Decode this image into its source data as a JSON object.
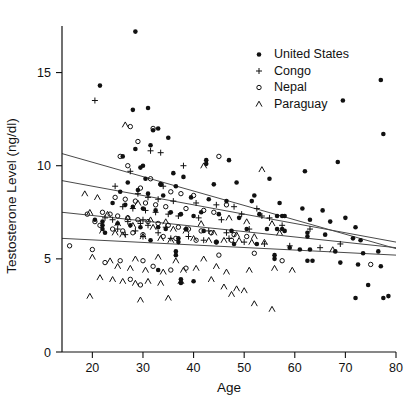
{
  "chart_data": {
    "type": "scatter",
    "title": "",
    "xlabel": "Age",
    "ylabel": "Testosterone Level (ng/dl)",
    "xlim": [
      14,
      80
    ],
    "ylim": [
      0,
      17.5
    ],
    "xticks": [
      20,
      30,
      40,
      50,
      60,
      70,
      80
    ],
    "yticks": [
      0,
      5,
      10,
      15
    ],
    "grid": false,
    "legend_position": "top-right",
    "legend": [
      {
        "name": "United States",
        "marker": "filled-circle"
      },
      {
        "name": "Congo",
        "marker": "plus"
      },
      {
        "name": "Nepal",
        "marker": "open-circle"
      },
      {
        "name": "Paraguay",
        "marker": "caret"
      }
    ],
    "series": [
      {
        "name": "United States",
        "marker": "filled-circle",
        "trendline": {
          "x0": 14,
          "y0": 10.65,
          "x1": 80,
          "y1": 5.55
        },
        "points": [
          [
            28.5,
            17.2
          ],
          [
            21.5,
            14.3
          ],
          [
            77.0,
            14.6
          ],
          [
            28.0,
            13.0
          ],
          [
            31.0,
            13.1
          ],
          [
            69.5,
            13.5
          ],
          [
            33.0,
            12.0
          ],
          [
            77.5,
            11.7
          ],
          [
            35.0,
            11.5
          ],
          [
            32.0,
            11.9
          ],
          [
            31.5,
            11.1
          ],
          [
            28.5,
            10.9
          ],
          [
            26.0,
            10.5
          ],
          [
            42.5,
            10.3
          ],
          [
            42.5,
            10.1
          ],
          [
            29.5,
            9.9
          ],
          [
            30.0,
            10.0
          ],
          [
            47.0,
            10.3
          ],
          [
            68.5,
            10.2
          ],
          [
            36.0,
            9.6
          ],
          [
            30.5,
            9.3
          ],
          [
            62.0,
            9.7
          ],
          [
            55.0,
            9.3
          ],
          [
            38.0,
            9.4
          ],
          [
            27.0,
            9.1
          ],
          [
            33.5,
            9.0
          ],
          [
            44.0,
            9.0
          ],
          [
            48.5,
            9.1
          ],
          [
            36.5,
            8.9
          ],
          [
            29.0,
            8.7
          ],
          [
            25.5,
            8.6
          ],
          [
            31.0,
            8.5
          ],
          [
            34.0,
            8.4
          ],
          [
            39.5,
            8.3
          ],
          [
            43.0,
            8.2
          ],
          [
            46.5,
            8.1
          ],
          [
            52.0,
            8.4
          ],
          [
            51.5,
            8.1
          ],
          [
            57.0,
            8.0
          ],
          [
            61.5,
            7.7
          ],
          [
            65.5,
            7.6
          ],
          [
            70.0,
            7.2
          ],
          [
            24.0,
            8.0
          ],
          [
            26.5,
            7.9
          ],
          [
            28.0,
            7.8
          ],
          [
            30.0,
            7.7
          ],
          [
            32.5,
            7.6
          ],
          [
            35.5,
            7.5
          ],
          [
            37.5,
            7.4
          ],
          [
            40.0,
            7.3
          ],
          [
            41.5,
            7.5
          ],
          [
            45.0,
            7.4
          ],
          [
            49.0,
            7.2
          ],
          [
            53.0,
            7.4
          ],
          [
            56.5,
            7.3
          ],
          [
            57.5,
            7.3
          ],
          [
            58.0,
            7.3
          ],
          [
            63.0,
            7.1
          ],
          [
            67.0,
            7.0
          ],
          [
            72.0,
            6.7
          ],
          [
            20.5,
            7.1
          ],
          [
            22.0,
            7.0
          ],
          [
            22.0,
            6.8
          ],
          [
            22.0,
            6.6
          ],
          [
            22.5,
            6.4
          ],
          [
            25.0,
            6.9
          ],
          [
            27.5,
            6.8
          ],
          [
            29.5,
            6.7
          ],
          [
            33.0,
            6.7
          ],
          [
            34.5,
            6.6
          ],
          [
            38.5,
            6.6
          ],
          [
            42.0,
            6.5
          ],
          [
            47.5,
            6.5
          ],
          [
            50.5,
            6.6
          ],
          [
            54.5,
            6.6
          ],
          [
            56.5,
            6.6
          ],
          [
            57.5,
            6.6
          ],
          [
            58.0,
            6.5
          ],
          [
            62.5,
            6.4
          ],
          [
            62.5,
            6.2
          ],
          [
            66.0,
            6.3
          ],
          [
            71.5,
            6.1
          ],
          [
            73.0,
            6.0
          ],
          [
            37.0,
            6.1
          ],
          [
            37.0,
            5.9
          ],
          [
            31.5,
            6.0
          ],
          [
            44.5,
            5.9
          ],
          [
            48.0,
            5.8
          ],
          [
            52.5,
            5.8
          ],
          [
            59.0,
            5.6
          ],
          [
            61.0,
            5.5
          ],
          [
            63.0,
            5.5
          ],
          [
            68.0,
            5.4
          ],
          [
            73.5,
            5.3
          ],
          [
            76.5,
            5.4
          ],
          [
            56.0,
            5.2
          ],
          [
            56.0,
            5.0
          ],
          [
            62.5,
            4.9
          ],
          [
            63.5,
            4.9
          ],
          [
            69.0,
            4.8
          ],
          [
            72.5,
            4.7
          ],
          [
            77.0,
            4.6
          ],
          [
            33.0,
            4.4
          ],
          [
            37.5,
            3.9
          ],
          [
            37.5,
            3.7
          ],
          [
            40.0,
            3.8
          ],
          [
            74.5,
            3.6
          ],
          [
            72.0,
            2.9
          ],
          [
            77.5,
            2.9
          ],
          [
            78.5,
            3.0
          ],
          [
            36.5,
            5.4
          ],
          [
            36.5,
            5.2
          ]
        ]
      },
      {
        "name": "Congo",
        "marker": "plus",
        "trendline": {
          "x0": 14,
          "y0": 9.2,
          "x1": 80,
          "y1": 5.9
        },
        "points": [
          [
            20.5,
            13.5
          ],
          [
            31.5,
            10.8
          ],
          [
            33.5,
            10.7
          ],
          [
            38.0,
            10.0
          ],
          [
            27.5,
            9.7
          ],
          [
            24.5,
            8.9
          ],
          [
            34.0,
            8.9
          ],
          [
            29.0,
            8.5
          ],
          [
            31.0,
            8.3
          ],
          [
            33.0,
            8.2
          ],
          [
            36.0,
            8.1
          ],
          [
            40.5,
            8.0
          ],
          [
            44.5,
            7.9
          ],
          [
            48.0,
            7.8
          ],
          [
            52.5,
            7.7
          ],
          [
            26.0,
            7.8
          ],
          [
            28.0,
            7.7
          ],
          [
            30.5,
            7.6
          ],
          [
            32.5,
            7.5
          ],
          [
            35.0,
            7.4
          ],
          [
            37.0,
            7.3
          ],
          [
            41.0,
            7.2
          ],
          [
            45.5,
            7.1
          ],
          [
            49.5,
            7.4
          ],
          [
            53.5,
            7.3
          ],
          [
            22.5,
            7.2
          ],
          [
            24.0,
            7.1
          ],
          [
            27.0,
            7.0
          ],
          [
            29.5,
            6.9
          ],
          [
            31.0,
            6.8
          ],
          [
            34.5,
            6.7
          ],
          [
            38.5,
            6.6
          ],
          [
            43.0,
            6.5
          ],
          [
            46.5,
            6.4
          ],
          [
            51.0,
            6.6
          ],
          [
            55.0,
            7.2
          ],
          [
            25.0,
            6.6
          ],
          [
            28.5,
            6.5
          ],
          [
            33.0,
            6.4
          ],
          [
            30.0,
            7.1
          ],
          [
            39.0,
            6.2
          ],
          [
            47.0,
            6.1
          ],
          [
            57.5,
            6.8
          ],
          [
            63.0,
            6.6
          ],
          [
            69.0,
            5.8
          ],
          [
            26.5,
            6.3
          ],
          [
            30.0,
            6.2
          ],
          [
            35.5,
            6.1
          ],
          [
            42.0,
            6.0
          ],
          [
            50.0,
            5.9
          ],
          [
            54.0,
            5.8
          ],
          [
            59.0,
            5.7
          ],
          [
            65.0,
            5.6
          ]
        ]
      },
      {
        "name": "Nepal",
        "marker": "open-circle",
        "trendline": {
          "x0": 14,
          "y0": 7.5,
          "x1": 80,
          "y1": 5.6
        },
        "points": [
          [
            27.5,
            12.1
          ],
          [
            32.0,
            12.0
          ],
          [
            29.0,
            11.3
          ],
          [
            25.5,
            10.5
          ],
          [
            45.0,
            10.5
          ],
          [
            27.0,
            10.0
          ],
          [
            31.5,
            9.3
          ],
          [
            33.5,
            9.0
          ],
          [
            29.5,
            8.8
          ],
          [
            35.5,
            8.6
          ],
          [
            37.5,
            8.5
          ],
          [
            40.0,
            8.4
          ],
          [
            24.5,
            8.3
          ],
          [
            26.5,
            8.2
          ],
          [
            28.5,
            8.1
          ],
          [
            30.5,
            8.0
          ],
          [
            32.5,
            7.9
          ],
          [
            34.5,
            7.8
          ],
          [
            38.5,
            7.7
          ],
          [
            42.0,
            7.6
          ],
          [
            44.0,
            7.5
          ],
          [
            46.5,
            7.9
          ],
          [
            22.0,
            7.5
          ],
          [
            23.5,
            7.4
          ],
          [
            25.0,
            7.3
          ],
          [
            27.0,
            7.2
          ],
          [
            29.0,
            7.1
          ],
          [
            31.0,
            7.0
          ],
          [
            33.0,
            6.9
          ],
          [
            35.0,
            6.8
          ],
          [
            37.0,
            6.7
          ],
          [
            39.0,
            6.6
          ],
          [
            41.5,
            6.5
          ],
          [
            43.5,
            6.4
          ],
          [
            48.0,
            6.3
          ],
          [
            50.5,
            6.2
          ],
          [
            19.0,
            7.4
          ],
          [
            20.5,
            7.0
          ],
          [
            21.5,
            6.8
          ],
          [
            24.0,
            6.6
          ],
          [
            26.0,
            6.5
          ],
          [
            28.0,
            6.4
          ],
          [
            30.0,
            6.3
          ],
          [
            34.0,
            6.2
          ],
          [
            36.5,
            6.1
          ],
          [
            40.5,
            6.0
          ],
          [
            44.5,
            5.9
          ],
          [
            47.5,
            6.0
          ],
          [
            15.5,
            5.7
          ],
          [
            20.0,
            5.5
          ],
          [
            22.5,
            4.8
          ],
          [
            25.5,
            4.9
          ],
          [
            30.0,
            4.9
          ],
          [
            32.0,
            4.6
          ],
          [
            35.5,
            4.4
          ],
          [
            38.5,
            4.5
          ],
          [
            57.5,
            4.9
          ],
          [
            75.0,
            4.7
          ],
          [
            27.5,
            3.9
          ],
          [
            29.5,
            3.6
          ],
          [
            45.0,
            5.2
          ],
          [
            52.0,
            5.3
          ]
        ]
      },
      {
        "name": "Paraguay",
        "marker": "caret",
        "trendline": {
          "x0": 14,
          "y0": 6.1,
          "x1": 80,
          "y1": 5.2
        },
        "points": [
          [
            26.5,
            12.2
          ],
          [
            42.0,
            10.0
          ],
          [
            53.5,
            9.8
          ],
          [
            18.5,
            8.5
          ],
          [
            21.0,
            8.3
          ],
          [
            29.0,
            8.0
          ],
          [
            19.5,
            7.5
          ],
          [
            23.0,
            7.4
          ],
          [
            27.0,
            7.2
          ],
          [
            31.5,
            7.1
          ],
          [
            34.5,
            7.0
          ],
          [
            41.5,
            6.9
          ],
          [
            47.0,
            7.2
          ],
          [
            50.5,
            7.0
          ],
          [
            25.0,
            6.9
          ],
          [
            28.0,
            6.8
          ],
          [
            32.0,
            6.7
          ],
          [
            36.0,
            6.6
          ],
          [
            38.5,
            6.5
          ],
          [
            44.0,
            6.4
          ],
          [
            48.5,
            6.3
          ],
          [
            52.0,
            6.2
          ],
          [
            55.5,
            6.9
          ],
          [
            57.0,
            6.4
          ],
          [
            22.0,
            6.5
          ],
          [
            24.5,
            6.4
          ],
          [
            26.0,
            6.3
          ],
          [
            30.0,
            6.2
          ],
          [
            33.5,
            6.1
          ],
          [
            35.5,
            6.0
          ],
          [
            40.0,
            6.1
          ],
          [
            43.0,
            6.0
          ],
          [
            46.0,
            6.0
          ],
          [
            49.0,
            6.0
          ],
          [
            51.5,
            5.9
          ],
          [
            54.0,
            5.9
          ],
          [
            20.0,
            5.1
          ],
          [
            23.5,
            4.9
          ],
          [
            28.5,
            5.0
          ],
          [
            33.0,
            5.1
          ],
          [
            36.5,
            4.9
          ],
          [
            42.0,
            5.0
          ],
          [
            25.0,
            4.6
          ],
          [
            27.5,
            4.5
          ],
          [
            30.5,
            4.4
          ],
          [
            34.0,
            4.3
          ],
          [
            38.0,
            4.4
          ],
          [
            40.5,
            4.5
          ],
          [
            44.5,
            4.6
          ],
          [
            46.5,
            4.3
          ],
          [
            51.0,
            4.4
          ],
          [
            56.0,
            4.5
          ],
          [
            59.5,
            4.4
          ],
          [
            67.5,
            5.5
          ],
          [
            21.5,
            4.0
          ],
          [
            24.0,
            3.9
          ],
          [
            26.0,
            3.8
          ],
          [
            28.5,
            3.7
          ],
          [
            31.0,
            3.8
          ],
          [
            33.5,
            3.7
          ],
          [
            37.5,
            3.8
          ],
          [
            43.5,
            3.9
          ],
          [
            19.5,
            3.0
          ],
          [
            29.5,
            2.8
          ],
          [
            35.0,
            2.9
          ],
          [
            47.5,
            3.1
          ],
          [
            52.0,
            2.6
          ],
          [
            55.5,
            2.3
          ],
          [
            46.0,
            3.5
          ],
          [
            48.5,
            3.4
          ],
          [
            50.0,
            3.3
          ]
        ]
      }
    ]
  },
  "colors": {
    "axis": "#111111",
    "marker": "#111111",
    "trendline": "#4a4a4a",
    "background": "#ffffff"
  }
}
